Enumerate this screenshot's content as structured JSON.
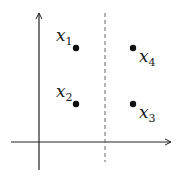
{
  "diagram": {
    "axes": {
      "x_axis": {
        "y": 142,
        "x_start": 11,
        "x_end": 172,
        "color": "#222222"
      },
      "y_axis": {
        "x": 39,
        "y_start": 170,
        "y_end": 12,
        "color": "#222222"
      }
    },
    "separator": {
      "type": "dashed",
      "x": 105,
      "y_start": 13,
      "y_end": 162,
      "color": "#555555"
    },
    "points": [
      {
        "id": "x1",
        "base": "x",
        "subscript": "1",
        "cx": 76,
        "cy": 48,
        "label_pos": "upper-left"
      },
      {
        "id": "x2",
        "base": "x",
        "subscript": "2",
        "cx": 76,
        "cy": 104,
        "label_pos": "upper-left"
      },
      {
        "id": "x3",
        "base": "x",
        "subscript": "3",
        "cx": 133,
        "cy": 104,
        "label_pos": "lower-right"
      },
      {
        "id": "x4",
        "base": "x",
        "subscript": "4",
        "cx": 133,
        "cy": 48,
        "label_pos": "lower-right"
      }
    ]
  }
}
